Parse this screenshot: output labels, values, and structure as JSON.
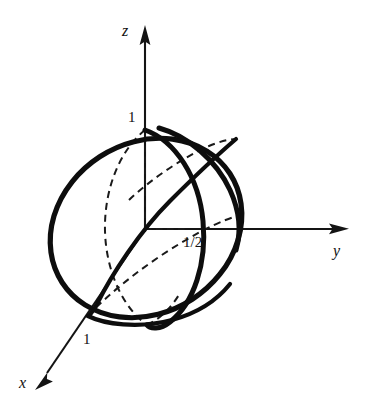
{
  "figure": {
    "background_color": "#ffffff",
    "ink_color": "#111111",
    "axes": [
      {
        "name": "z",
        "label": "z",
        "direction": "up",
        "origin": [
          145,
          229
        ],
        "tip": [
          145,
          28
        ]
      },
      {
        "name": "y",
        "label": "y",
        "direction": "right",
        "origin": [
          145,
          229
        ],
        "tip": [
          347,
          229
        ]
      },
      {
        "name": "x",
        "label": "x",
        "direction": "down-left",
        "origin": [
          145,
          229
        ],
        "tip": [
          37,
          387
        ]
      }
    ],
    "tick_labels": [
      {
        "name": "z-intercept",
        "text": "1",
        "axis": "z",
        "value": 1,
        "position": [
          131,
          117
        ]
      },
      {
        "name": "x-intercept",
        "text": "1",
        "axis": "x",
        "value": 1,
        "position": [
          87,
          339
        ]
      },
      {
        "name": "y-intercept",
        "text": "1/2",
        "axis": "y",
        "value": 0.5,
        "position": [
          195,
          243
        ]
      }
    ],
    "shapes": [
      {
        "name": "sphere-outline",
        "type": "ellipse-tilted",
        "style": "solid-thick",
        "center": [
          146,
          228
        ],
        "rx": 100,
        "ry": 86,
        "rotation_deg": -32
      },
      {
        "name": "great-circle-front",
        "type": "ellipse-tilted",
        "style": "solid-thick",
        "center": [
          150,
          228
        ],
        "rx": 40,
        "ry": 99,
        "rotation_deg": -14
      },
      {
        "name": "great-circle-tilted",
        "type": "ellipse-tilted",
        "style": "solid-thick",
        "center": [
          146,
          228
        ],
        "rx": 98,
        "ry": 37,
        "rotation_deg": -38
      },
      {
        "name": "hidden-circle-back",
        "type": "ellipse-tilted",
        "style": "dashed",
        "center": [
          139,
          228
        ],
        "rx": 44,
        "ry": 98,
        "rotation_deg": -10
      },
      {
        "name": "hidden-circle-equator",
        "type": "ellipse-tilted",
        "style": "dashed",
        "center": [
          146,
          228
        ],
        "rx": 98,
        "ry": 37,
        "rotation_deg": -38
      }
    ],
    "guides": [
      {
        "name": "guide-z-to-sphere-top",
        "from": [
          145,
          229
        ],
        "to": [
          145,
          130
        ],
        "style": "dashed"
      },
      {
        "name": "guide-origin-to-half",
        "from": [
          145,
          229
        ],
        "to": [
          184,
          229
        ],
        "style": "dashed"
      }
    ]
  }
}
